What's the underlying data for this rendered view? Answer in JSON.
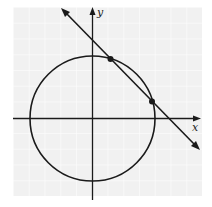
{
  "diagram": {
    "type": "coordinate-plane",
    "axes": {
      "x_label": "x",
      "y_label": "y"
    },
    "grid": {
      "visible": true,
      "color": "#f0f0f0",
      "line_color": "#ffffff"
    },
    "circle": {
      "center": [
        0,
        0
      ],
      "description": "circle centered at origin"
    },
    "line": {
      "slope": "negative",
      "description": "line with arrows intersecting circle at two points"
    },
    "intersection_points": [
      {
        "label": "",
        "position": "upper point on circle in quadrant I"
      },
      {
        "label": "",
        "position": "lower point on circle in quadrant I"
      }
    ],
    "colors": {
      "stroke": "#1a1a1a",
      "background": "#ffffff",
      "grid_bg": "#f1f1f1"
    }
  }
}
